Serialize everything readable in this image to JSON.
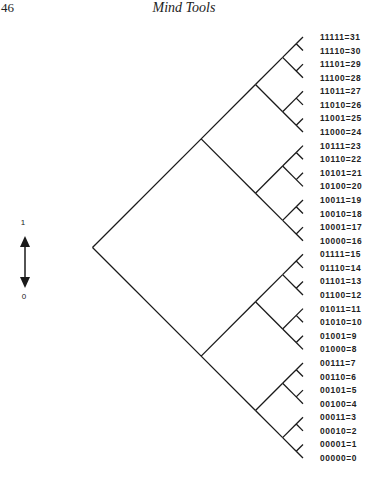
{
  "page": {
    "number": "46",
    "running_head": "Mind Tools"
  },
  "legend": {
    "top_label": "1",
    "bottom_label": "0",
    "icon": "double-headed-vertical-arrow"
  },
  "diagram": {
    "type": "binary-tree",
    "orientation": "left-to-right",
    "depth": 5,
    "leaf_count": 32,
    "line_color": "#1a1a1a",
    "leaves": [
      "00000=0",
      "00001=1",
      "00010=2",
      "00011=3",
      "00100=4",
      "00101=5",
      "00110=6",
      "00111=7",
      "01000=8",
      "01001=9",
      "01010=10",
      "01011=11",
      "01100=12",
      "01101=13",
      "01110=14",
      "01111=15",
      "10000=16",
      "10001=17",
      "10010=18",
      "10011=19",
      "10100=20",
      "10101=21",
      "10110=22",
      "10111=23",
      "11000=24",
      "11001=25",
      "11010=26",
      "11011=27",
      "11100=28",
      "11101=29",
      "11110=30",
      "11111=31"
    ]
  }
}
